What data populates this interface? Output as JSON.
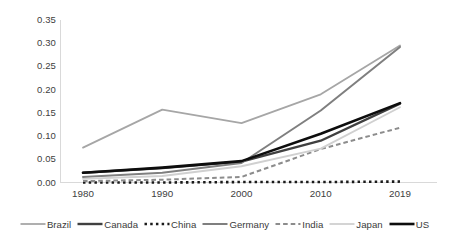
{
  "chart_data": {
    "type": "line",
    "title": "",
    "subtitle": "",
    "xlabel": "",
    "ylabel": "",
    "x": [
      1980,
      1990,
      2000,
      2010,
      2019
    ],
    "categories": [
      "1980",
      "1990",
      "2000",
      "2010",
      "2019"
    ],
    "xtick_labels": [
      "1980",
      "1990",
      "2000",
      "2010",
      "2019"
    ],
    "ytick_labels": [
      "0.35",
      "0.30",
      "0.25",
      "0.20",
      "0.15",
      "0.10",
      "0.05",
      "0.00"
    ],
    "ytick_values": [
      0.35,
      0.3,
      0.25,
      0.2,
      0.15,
      0.1,
      0.05,
      0.0
    ],
    "ylim": [
      0.0,
      0.35
    ],
    "grid": false,
    "legend_position": "bottom",
    "series": [
      {
        "name": "Brazil",
        "values": [
          0.075,
          0.157,
          0.128,
          0.19,
          0.295
        ],
        "color": "#a6a6a6",
        "style": "solid",
        "width": 1.8
      },
      {
        "name": "Canada",
        "values": [
          0.021,
          0.031,
          0.045,
          0.09,
          0.17
        ],
        "color": "#404040",
        "style": "solid",
        "width": 2.4
      },
      {
        "name": "China",
        "values": [
          0.0,
          0.0,
          0.001,
          0.001,
          0.002
        ],
        "color": "#1a1a1a",
        "style": "dotted",
        "width": 2.6
      },
      {
        "name": "Germany",
        "values": [
          0.012,
          0.021,
          0.042,
          0.155,
          0.292
        ],
        "color": "#7f7f7f",
        "style": "solid",
        "width": 2.0
      },
      {
        "name": "India",
        "values": [
          0.003,
          0.006,
          0.012,
          0.072,
          0.118
        ],
        "color": "#8c8c8c",
        "style": "dashed",
        "width": 2.0
      },
      {
        "name": "Japan",
        "values": [
          0.008,
          0.014,
          0.035,
          0.073,
          0.162
        ],
        "color": "#d0d0d0",
        "style": "solid",
        "width": 1.8
      },
      {
        "name": "US",
        "values": [
          0.021,
          0.032,
          0.046,
          0.105,
          0.171
        ],
        "color": "#0d0d0d",
        "style": "solid",
        "width": 2.6
      }
    ]
  },
  "legend": {
    "items": [
      {
        "label": "Brazil"
      },
      {
        "label": "Canada"
      },
      {
        "label": "China"
      },
      {
        "label": "Germany"
      },
      {
        "label": "India"
      },
      {
        "label": "Japan"
      },
      {
        "label": "US"
      }
    ]
  },
  "colors": {
    "axis": "#d9d9d9",
    "text": "#404040",
    "background": "#ffffff"
  }
}
